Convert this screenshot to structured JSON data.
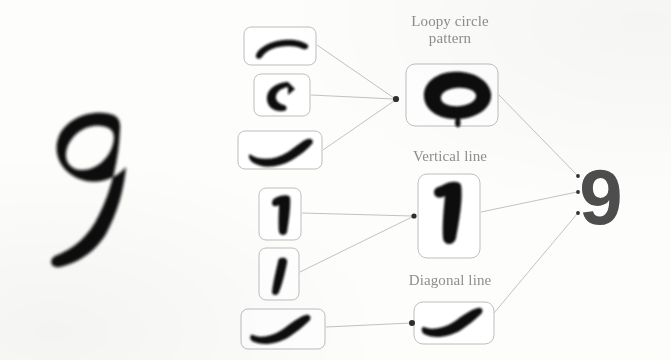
{
  "diagram": {
    "title_text": "",
    "input_digit": {
      "name": "handwritten-9",
      "value": "9"
    },
    "output_digit": {
      "name": "recognized-9",
      "value": "9"
    },
    "feature_labels": [
      {
        "id": "loopy",
        "text": "Loopy circle\npattern"
      },
      {
        "id": "vertical",
        "text": "Vertical line"
      },
      {
        "id": "diagonal",
        "text": "Diagonal line"
      }
    ],
    "colors": {
      "ink": "#111111",
      "ink_soft": "#2a2a2a",
      "output_ink": "#4a4a4a",
      "label_text": "#8e8e8e",
      "box_stroke": "#b9b9b9",
      "edge_stroke": "#bdbdbd",
      "node_dot": "#333333",
      "background": "#fdfdfc"
    },
    "stroke_boxes": [
      {
        "id": "stroke-arc-top",
        "label": "arc-top-curve",
        "x": 244,
        "y": 27,
        "w": 72,
        "h": 38
      },
      {
        "id": "stroke-c-curve",
        "label": "left-c-curve",
        "x": 254,
        "y": 74,
        "w": 56,
        "h": 42
      },
      {
        "id": "stroke-swoosh",
        "label": "upward-swoosh",
        "x": 238,
        "y": 131,
        "w": 84,
        "h": 38
      },
      {
        "id": "stroke-hook-stem",
        "label": "hooked-vertical-stem",
        "x": 259,
        "y": 188,
        "w": 42,
        "h": 52
      },
      {
        "id": "stroke-slant-short",
        "label": "short-slant",
        "x": 259,
        "y": 248,
        "w": 40,
        "h": 52
      },
      {
        "id": "stroke-diag-curve",
        "label": "diagonal-curve",
        "x": 241,
        "y": 309,
        "w": 84,
        "h": 40
      }
    ],
    "feature_boxes": [
      {
        "id": "feature-loopy",
        "label": "loopy-circle-pattern",
        "x": 406,
        "y": 64,
        "w": 92,
        "h": 62
      },
      {
        "id": "feature-vertical",
        "label": "vertical-line",
        "x": 418,
        "y": 174,
        "w": 62,
        "h": 84
      },
      {
        "id": "feature-diagonal",
        "label": "diagonal-line",
        "x": 414,
        "y": 302,
        "w": 80,
        "h": 42
      }
    ],
    "nodes": [
      {
        "id": "node-loopy",
        "x": 396,
        "y": 99
      },
      {
        "id": "node-vertical",
        "x": 414,
        "y": 216
      },
      {
        "id": "node-diagonal",
        "x": 412,
        "y": 323
      },
      {
        "id": "node-out-1",
        "x": 578,
        "y": 176
      },
      {
        "id": "node-out-2",
        "x": 578,
        "y": 192
      },
      {
        "id": "node-out-3",
        "x": 578,
        "y": 213
      }
    ],
    "edges": [
      {
        "from": "stroke-arc-top",
        "to": "node-loopy"
      },
      {
        "from": "stroke-c-curve",
        "to": "node-loopy"
      },
      {
        "from": "stroke-swoosh",
        "to": "node-loopy"
      },
      {
        "from": "stroke-hook-stem",
        "to": "node-vertical"
      },
      {
        "from": "stroke-slant-short",
        "to": "node-vertical"
      },
      {
        "from": "stroke-diag-curve",
        "to": "node-diagonal"
      },
      {
        "from": "feature-loopy",
        "to": "node-out-1"
      },
      {
        "from": "feature-vertical",
        "to": "node-out-2"
      },
      {
        "from": "feature-diagonal",
        "to": "node-out-3"
      }
    ]
  }
}
